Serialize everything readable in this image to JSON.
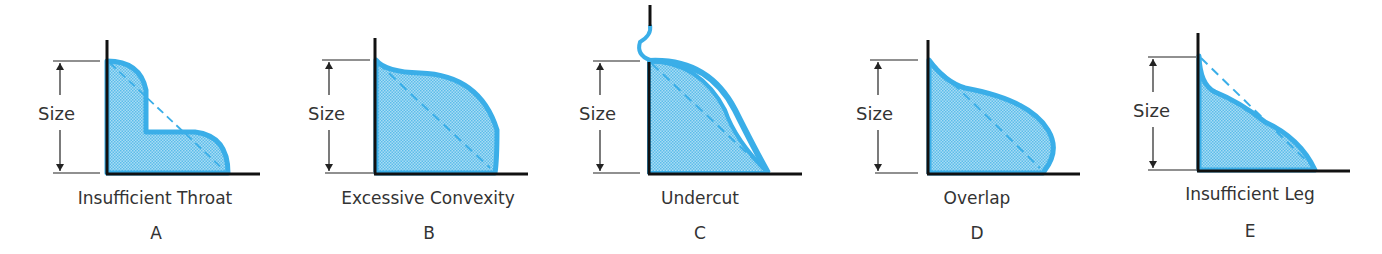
{
  "colors": {
    "outline": "#3aaee8",
    "fill": "#8fd0f0",
    "plate": "#1a1a1a",
    "dim": "#333333"
  },
  "dimension_label": "Size",
  "panels": [
    {
      "id": "A",
      "caption": "Insufficient Throat",
      "letter": "A"
    },
    {
      "id": "B",
      "caption": "Excessive Convexity",
      "letter": "B"
    },
    {
      "id": "C",
      "caption": "Undercut",
      "letter": "C"
    },
    {
      "id": "D",
      "caption": "Overlap",
      "letter": "D"
    },
    {
      "id": "E",
      "caption": "Insufficient Leg",
      "letter": "E"
    }
  ]
}
